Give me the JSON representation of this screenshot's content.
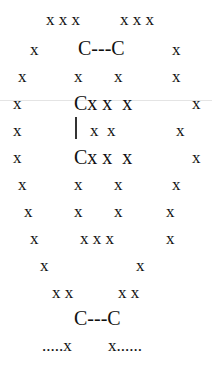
{
  "diagram": {
    "rows": [
      {
        "id": "r1",
        "items": [
          {
            "t": "x x x",
            "x": 46,
            "y": 11
          },
          {
            "t": "x x x",
            "x": 120,
            "y": 11
          }
        ]
      },
      {
        "id": "r2",
        "items": [
          {
            "t": "x",
            "x": 30,
            "y": 41
          },
          {
            "t": "C---C",
            "x": 78,
            "y": 38,
            "big": true
          },
          {
            "t": "x",
            "x": 172,
            "y": 41
          }
        ]
      },
      {
        "id": "r3",
        "items": [
          {
            "t": "x",
            "x": 18,
            "y": 68
          },
          {
            "t": "x",
            "x": 74,
            "y": 68
          },
          {
            "t": "x",
            "x": 114,
            "y": 68
          },
          {
            "t": "x",
            "x": 172,
            "y": 68
          }
        ]
      },
      {
        "id": "r4",
        "items": [
          {
            "t": "x",
            "x": 13,
            "y": 95
          },
          {
            "t": "Cx x  x",
            "x": 74,
            "y": 93,
            "big": true
          },
          {
            "t": "x",
            "x": 192,
            "y": 95
          }
        ]
      },
      {
        "id": "r5",
        "items": [
          {
            "t": "x",
            "x": 13,
            "y": 122
          },
          {
            "t": "x  x",
            "x": 90,
            "y": 122
          },
          {
            "t": "x",
            "x": 176,
            "y": 122
          }
        ]
      },
      {
        "id": "r6",
        "items": [
          {
            "t": "x",
            "x": 13,
            "y": 149
          },
          {
            "t": "Cx x  x",
            "x": 74,
            "y": 147,
            "big": true
          },
          {
            "t": "x",
            "x": 192,
            "y": 149
          }
        ]
      },
      {
        "id": "r7",
        "items": [
          {
            "t": "x",
            "x": 18,
            "y": 176
          },
          {
            "t": "x",
            "x": 74,
            "y": 176
          },
          {
            "t": "x",
            "x": 114,
            "y": 176
          },
          {
            "t": "x",
            "x": 172,
            "y": 176
          }
        ]
      },
      {
        "id": "r8",
        "items": [
          {
            "t": "x",
            "x": 24,
            "y": 203
          },
          {
            "t": "x",
            "x": 74,
            "y": 203
          },
          {
            "t": "x",
            "x": 114,
            "y": 203
          },
          {
            "t": "x",
            "x": 166,
            "y": 203
          }
        ]
      },
      {
        "id": "r9",
        "items": [
          {
            "t": "x",
            "x": 30,
            "y": 230
          },
          {
            "t": "x x x",
            "x": 80,
            "y": 230
          },
          {
            "t": "x",
            "x": 166,
            "y": 230
          }
        ]
      },
      {
        "id": "r10",
        "items": [
          {
            "t": "x",
            "x": 40,
            "y": 257
          },
          {
            "t": "x",
            "x": 136,
            "y": 257
          }
        ]
      },
      {
        "id": "r11",
        "items": [
          {
            "t": "x x",
            "x": 52,
            "y": 284
          },
          {
            "t": "x x",
            "x": 118,
            "y": 284
          }
        ]
      },
      {
        "id": "r12",
        "items": [
          {
            "t": "C---C",
            "x": 74,
            "y": 308,
            "big": true
          }
        ]
      },
      {
        "id": "r13",
        "items": [
          {
            "t": ".....x",
            "x": 42,
            "y": 337
          },
          {
            "t": "x......",
            "x": 108,
            "y": 337
          }
        ]
      }
    ],
    "bond_vertical": {
      "x": 75,
      "top": 117,
      "height": 22
    }
  }
}
